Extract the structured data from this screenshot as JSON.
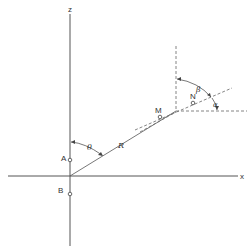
{
  "diagram": {
    "axes": {
      "z_label": "z",
      "x_label": "x"
    },
    "points": {
      "A": "A",
      "B": "B",
      "M": "M",
      "N": "N"
    },
    "distance_label": "R",
    "angles": {
      "theta": "θ",
      "beta": "β",
      "alpha": "α"
    },
    "colors": {
      "line": "#555555",
      "text": "#333333",
      "background": "#ffffff"
    }
  }
}
